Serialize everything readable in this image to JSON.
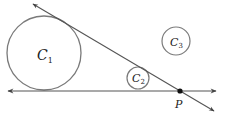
{
  "diagram": {
    "title": "",
    "circles": [
      {
        "id": "C1",
        "label": "C",
        "subscript": "1",
        "cx": 44,
        "cy": 53,
        "r": 37
      },
      {
        "id": "C2",
        "label": "C",
        "subscript": "2",
        "cx": 138,
        "cy": 78,
        "r": 11
      },
      {
        "id": "C3",
        "label": "C",
        "subscript": "3",
        "cx": 176,
        "cy": 41,
        "r": 14
      }
    ],
    "lines": [
      {
        "id": "horizontal-line",
        "x1": 8,
        "y1": 91,
        "x2": 216,
        "y2": 91,
        "arrows": "both"
      },
      {
        "id": "tangent-line",
        "x1": 33,
        "y1": 4,
        "x2": 214,
        "y2": 111,
        "arrows": "both"
      }
    ],
    "point": {
      "label": "P",
      "x": 180,
      "y": 91
    },
    "colors": {
      "circle": "#7a7a7a",
      "line": "#555555",
      "point": "#111111"
    }
  }
}
